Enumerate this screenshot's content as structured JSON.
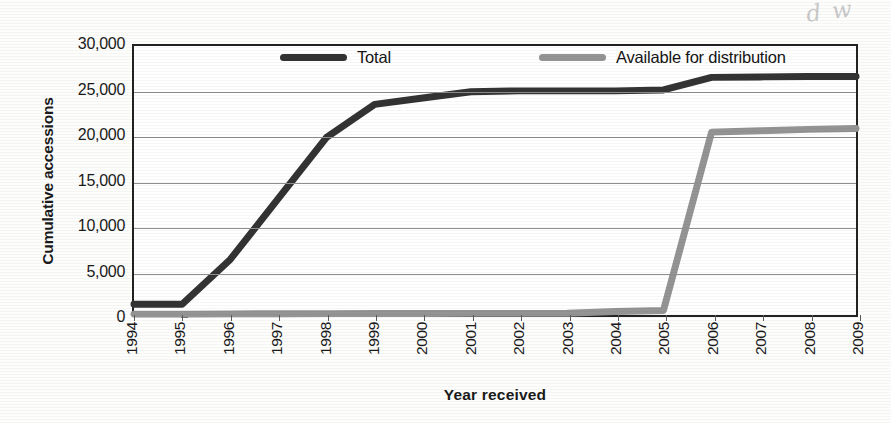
{
  "chart_data": {
    "type": "line",
    "title": "",
    "xlabel": "Year received",
    "ylabel": "Cumulative accessions",
    "categories": [
      "1994",
      "1995",
      "1996",
      "1997",
      "1998",
      "1999",
      "2000",
      "2001",
      "2002",
      "2003",
      "2004",
      "2005",
      "2006",
      "2007",
      "2008",
      "2009"
    ],
    "ylim": [
      0,
      30000
    ],
    "ytick_labels": [
      "0",
      "5,000",
      "10,000",
      "15,000",
      "20,000",
      "25,000",
      "30,000"
    ],
    "ytick_values": [
      0,
      5000,
      10000,
      15000,
      20000,
      25000,
      30000
    ],
    "grid": "horizontal",
    "legend_position": "top-inside",
    "series": [
      {
        "name": "Total",
        "color": "#333333",
        "values": [
          1200,
          1200,
          6200,
          13000,
          19800,
          23500,
          24200,
          24900,
          25000,
          25000,
          25000,
          25100,
          26500,
          26550,
          26600,
          26600
        ]
      },
      {
        "name": "Available for distribution",
        "color": "#949494",
        "values": [
          100,
          100,
          120,
          140,
          150,
          160,
          170,
          180,
          190,
          200,
          400,
          500,
          20400,
          20550,
          20700,
          20800
        ]
      }
    ]
  },
  "legend": {
    "items": [
      {
        "label": "Total",
        "color": "#333333"
      },
      {
        "label": "Available for distribution",
        "color": "#949494"
      }
    ]
  },
  "annotations": {
    "handwriting_top_right": "d w",
    "handwriting_mark": "·′"
  }
}
